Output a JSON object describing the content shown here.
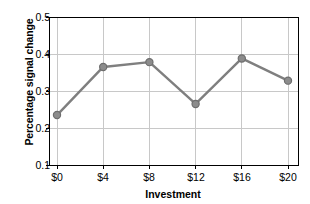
{
  "chart_data": {
    "type": "line",
    "title": "",
    "xlabel": "Investment",
    "ylabel": "Percentage signal change",
    "categories": [
      "$0",
      "$4",
      "$8",
      "$12",
      "$16",
      "$20"
    ],
    "x": [
      0,
      4,
      8,
      12,
      16,
      20
    ],
    "values": [
      0.235,
      0.365,
      0.378,
      0.265,
      0.388,
      0.328
    ],
    "series": [
      {
        "name": "Percentage signal change",
        "values": [
          0.235,
          0.365,
          0.378,
          0.265,
          0.388,
          0.328
        ]
      }
    ],
    "ylim": [
      0.1,
      0.5
    ],
    "yticks": [
      "0.1",
      "0.2",
      "0.3",
      "0.4",
      "0.5"
    ],
    "ytick_values": [
      0.1,
      0.2,
      0.3,
      0.4,
      0.5
    ],
    "xticks": [
      "$0",
      "$4",
      "$8",
      "$12",
      "$16",
      "$20"
    ],
    "grid": "both",
    "legend": "none",
    "marker": "circle",
    "line_color": "#7f7f7f",
    "marker_color": "#8c8c8c",
    "marker_edge_color": "#6e6e6e",
    "grid_color": "#c8c8c8",
    "axis_color": "#000000",
    "background": "#ffffff"
  }
}
